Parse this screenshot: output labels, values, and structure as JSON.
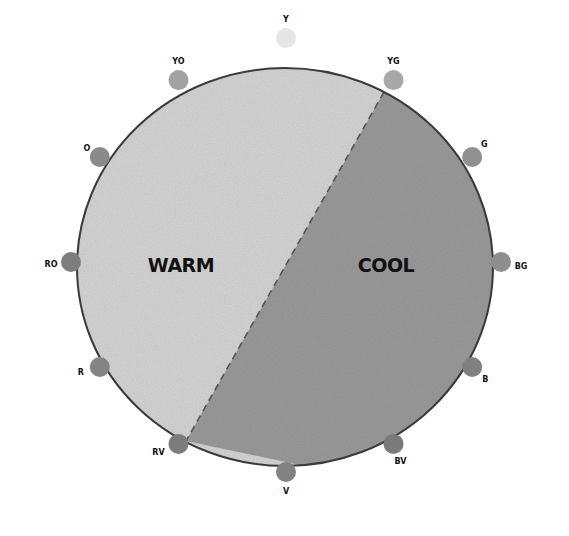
{
  "diagram": {
    "regions": [
      {
        "id": "warm",
        "label": "WARM",
        "fill": "#d4d4d4"
      },
      {
        "id": "cool",
        "label": "COOL",
        "fill": "#9a9a9a"
      }
    ],
    "divider": {
      "style": "dashed",
      "between": [
        "YG",
        "RV"
      ]
    },
    "outline_color": "#3a3a3a",
    "swatches": [
      {
        "label": "Y",
        "color": "#e6e6e6",
        "angle_deg": 0
      },
      {
        "label": "YG",
        "color": "#a8a8a8",
        "angle_deg": 30
      },
      {
        "label": "G",
        "color": "#909090",
        "angle_deg": 60
      },
      {
        "label": "BG",
        "color": "#8e8e8e",
        "angle_deg": 90
      },
      {
        "label": "B",
        "color": "#808080",
        "angle_deg": 120
      },
      {
        "label": "BV",
        "color": "#7a7a7a",
        "angle_deg": 150
      },
      {
        "label": "V",
        "color": "#828282",
        "angle_deg": 180
      },
      {
        "label": "RV",
        "color": "#7c7c7c",
        "angle_deg": 210
      },
      {
        "label": "R",
        "color": "#848484",
        "angle_deg": 240
      },
      {
        "label": "RO",
        "color": "#7e7e7e",
        "angle_deg": 270
      },
      {
        "label": "O",
        "color": "#8a8a8a",
        "angle_deg": 300
      },
      {
        "label": "YO",
        "color": "#a2a2a2",
        "angle_deg": 330
      }
    ]
  }
}
